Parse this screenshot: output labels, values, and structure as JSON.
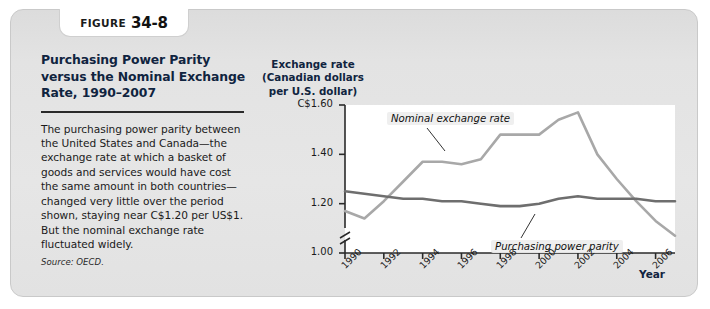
{
  "figure": {
    "tab_word": "FIGURE",
    "tab_number": "34-8",
    "title": "Purchasing Power Parity versus the Nominal Exchange Rate, 1990–2007",
    "body": "The purchasing power parity between the United States and Canada—the exchange rate at which a basket of goods and services would have cost the same amount in both countries—changed very little over the period shown, staying near C$1.20 per US$1. But the nominal exchange rate fluctuated widely.",
    "source": "Source: OECD."
  },
  "colors": {
    "panel_bg": "#e4e4e4",
    "panel_border": "#c9c9c9",
    "title_color": "#10243f",
    "nominal_line": "#a8a8a8",
    "ppp_line": "#6e6e6e",
    "axis": "#2a2a2a",
    "plot_bg": "#ffffff"
  },
  "chart_data": {
    "type": "line",
    "title": "Purchasing Power Parity versus the Nominal Exchange Rate, 1990–2007",
    "xlabel": "Year",
    "ylabel": "Exchange rate (Canadian dollars per U.S. dollar)",
    "ylabel_lines": [
      "Exchange rate",
      "(Canadian dollars",
      "per U.S. dollar)"
    ],
    "ylim": [
      1.0,
      1.6
    ],
    "yticks": [
      1.0,
      1.2,
      1.4,
      1.6
    ],
    "ytick_labels": [
      "1.00",
      "1.20",
      "1.40",
      "C$1.60"
    ],
    "axis_break": true,
    "grid": false,
    "xlim": [
      1990,
      2007
    ],
    "xticks": [
      1990,
      1992,
      1994,
      1996,
      1998,
      2000,
      2002,
      2004,
      2006
    ],
    "xtick_labels": [
      "1990",
      "1992",
      "1994",
      "1996",
      "1998",
      "2000",
      "2002",
      "2004",
      "2006"
    ],
    "x": [
      1990,
      1991,
      1992,
      1993,
      1994,
      1995,
      1996,
      1997,
      1998,
      1999,
      2000,
      2001,
      2002,
      2003,
      2004,
      2005,
      2006,
      2007
    ],
    "series": [
      {
        "name": "Nominal exchange rate",
        "color": "#a8a8a8",
        "annotation": "Nominal exchange rate",
        "values": [
          1.17,
          1.14,
          1.21,
          1.29,
          1.37,
          1.37,
          1.36,
          1.38,
          1.48,
          1.48,
          1.48,
          1.54,
          1.57,
          1.4,
          1.3,
          1.21,
          1.13,
          1.07
        ]
      },
      {
        "name": "Purchasing power parity",
        "color": "#6e6e6e",
        "annotation": "Purchasing power parity",
        "values": [
          1.25,
          1.24,
          1.23,
          1.22,
          1.22,
          1.21,
          1.21,
          1.2,
          1.19,
          1.19,
          1.2,
          1.22,
          1.23,
          1.22,
          1.22,
          1.22,
          1.21,
          1.21
        ]
      }
    ],
    "legend_position": "inline-annotations"
  }
}
